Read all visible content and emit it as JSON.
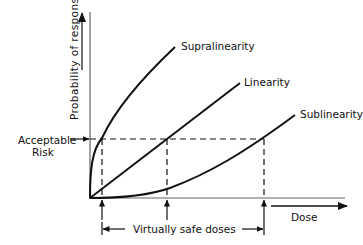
{
  "diagram": {
    "y_axis_label": "Probability of response",
    "x_axis_label": "Dose",
    "acceptable_risk_label_line1": "Acceptable",
    "acceptable_risk_label_line2": "Risk",
    "curves": [
      {
        "name": "Supralinearity"
      },
      {
        "name": "Linearity"
      },
      {
        "name": "Sublinearity"
      }
    ],
    "range_label": "Virtually safe doses",
    "colors": {
      "line": "#111111",
      "axis": "#555555"
    }
  }
}
